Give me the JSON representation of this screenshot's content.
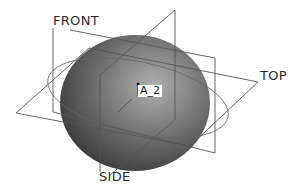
{
  "diagram": {
    "planes": [
      {
        "name": "FRONT",
        "label": "FRONT"
      },
      {
        "name": "TOP",
        "label": "TOP"
      },
      {
        "name": "SIDE",
        "label": "SIDE"
      }
    ],
    "axis_label": "A_2",
    "colors": {
      "background": "#ffffff",
      "plane_lines": "#555555",
      "sphere_dark": "#3a3a3a",
      "sphere_mid": "#707070",
      "sphere_light": "#a8a8a8"
    }
  }
}
